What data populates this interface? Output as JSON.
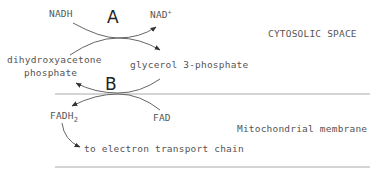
{
  "diagram": {
    "type": "glycerol-phosphate shuttle",
    "reactions": {
      "A": {
        "label": "A",
        "inputs": [
          "NADH",
          "dihydroxyacetone phosphate"
        ],
        "outputs": [
          "NAD+",
          "glycerol 3-phosphate"
        ]
      },
      "B": {
        "label": "B",
        "inputs": [
          "glycerol 3-phosphate",
          "FAD"
        ],
        "outputs": [
          "dihydroxyacetone phosphate",
          "FADH2"
        ]
      }
    },
    "labels": {
      "nadh": "NADH",
      "nad_base": "NAD",
      "nad_sup": "+",
      "dhap_line1": "dihydroxyacetone",
      "dhap_line2": "phosphate",
      "g3p": "glycerol 3-phosphate",
      "fadh_base": "FADH",
      "fadh_sub": "2",
      "fad": "FAD",
      "etc": "to electron transport chain",
      "cytosolic": "CYTOSOLIC SPACE",
      "membrane": "Mitochondrial membrane",
      "a": "A",
      "b": "B"
    },
    "colors": {
      "line": "#999999",
      "arrow": "#333333",
      "text": "#555555"
    }
  }
}
